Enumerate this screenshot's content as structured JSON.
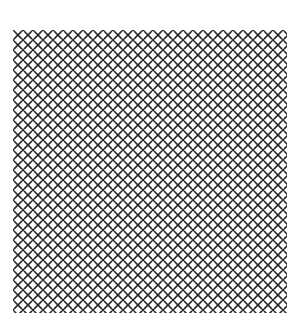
{
  "image": {
    "kind": "decorative-pattern-swatch",
    "width_px": 298,
    "height_px": 321,
    "page_background_color": "#ffffff"
  },
  "swatch": {
    "label": "cross-and-dot repeating pattern",
    "left_px": 13,
    "top_px": 30,
    "width_px": 274,
    "height_px": 283,
    "background_color": "#ffffff"
  },
  "motifs": {
    "primary": {
      "name": "x-glyph",
      "shape": "diagonal-cross",
      "color": "#2a2a2a",
      "stroke_px": 1.6,
      "size_px": 7
    },
    "secondary": {
      "name": "dot-glyph",
      "shape": "square-dot",
      "color": "#2a2a2a",
      "size_px": 2
    }
  },
  "lattice": {
    "period_px": 10,
    "half_period_px": 5,
    "columns": 28,
    "rows": 29,
    "arrangement": "x-on-grid-dots-at-half-offset"
  }
}
